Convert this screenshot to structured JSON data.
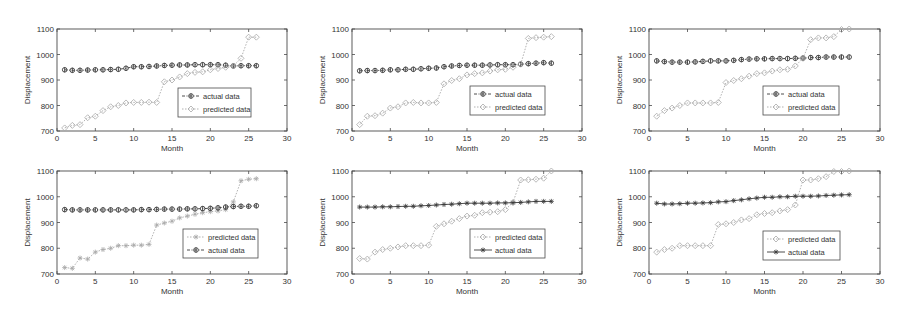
{
  "figure": {
    "layout": {
      "rows": 2,
      "cols": 3
    },
    "colors": {
      "axis": "#4a4a4a",
      "actual": "#3a3a3a",
      "predicted": "#a8a8a8",
      "background": "#ffffff"
    }
  },
  "chart_data": [
    {
      "type": "line",
      "panel": "top-left",
      "title": "",
      "xlabel": "Month",
      "ylabel": "Displacement",
      "xlim": [
        0,
        30
      ],
      "ylim": [
        700,
        1100
      ],
      "xticks": [
        0,
        5,
        10,
        15,
        20,
        25,
        30
      ],
      "yticks": [
        700,
        800,
        900,
        1000,
        1100
      ],
      "grid": false,
      "legend": {
        "position": "lower-right-inset",
        "entries": [
          "actual data",
          "predicted data"
        ]
      },
      "x": [
        1,
        2,
        3,
        4,
        5,
        6,
        7,
        8,
        9,
        10,
        11,
        12,
        13,
        14,
        15,
        16,
        17,
        18,
        19,
        20,
        21,
        22,
        23,
        24,
        25,
        26
      ],
      "series": [
        {
          "name": "actual data",
          "style": "dash-dot, circle-star marker, dark",
          "values": [
            940,
            938,
            938,
            939,
            940,
            940,
            941,
            942,
            946,
            952,
            952,
            953,
            955,
            957,
            958,
            959,
            959,
            960,
            960,
            960,
            960,
            958,
            955,
            956,
            956,
            956
          ]
        },
        {
          "name": "predicted data",
          "style": "dotted, diamond marker, light",
          "values": [
            712,
            722,
            725,
            752,
            758,
            780,
            795,
            800,
            810,
            812,
            812,
            813,
            812,
            893,
            900,
            912,
            925,
            930,
            932,
            940,
            945,
            950,
            955,
            985,
            1068,
            1068
          ]
        }
      ]
    },
    {
      "type": "line",
      "panel": "top-middle",
      "title": "",
      "xlabel": "Month",
      "ylabel": "Displacement",
      "xlim": [
        0,
        30
      ],
      "ylim": [
        700,
        1100
      ],
      "xticks": [
        0,
        5,
        10,
        15,
        20,
        25,
        30
      ],
      "yticks": [
        700,
        800,
        900,
        1000,
        1100
      ],
      "grid": false,
      "legend": {
        "position": "lower-right-inset",
        "entries": [
          "actual data",
          "predicted data"
        ]
      },
      "x": [
        1,
        2,
        3,
        4,
        5,
        6,
        7,
        8,
        9,
        10,
        11,
        12,
        13,
        14,
        15,
        16,
        17,
        18,
        19,
        20,
        21,
        22,
        23,
        24,
        25,
        26
      ],
      "series": [
        {
          "name": "actual data",
          "style": "dash-dot, circle-star marker, dark",
          "values": [
            936,
            937,
            937,
            938,
            940,
            940,
            942,
            942,
            944,
            946,
            947,
            952,
            955,
            957,
            958,
            958,
            958,
            959,
            960,
            960,
            960,
            962,
            964,
            966,
            968,
            966
          ]
        },
        {
          "name": "predicted data",
          "style": "dotted, diamond marker, light",
          "values": [
            725,
            758,
            760,
            770,
            790,
            795,
            810,
            812,
            810,
            810,
            812,
            885,
            898,
            905,
            920,
            925,
            928,
            935,
            940,
            942,
            950,
            962,
            1063,
            1066,
            1068,
            1070
          ]
        }
      ]
    },
    {
      "type": "line",
      "panel": "top-right",
      "title": "",
      "xlabel": "Month",
      "ylabel": "Displacement",
      "xlim": [
        0,
        30
      ],
      "ylim": [
        700,
        1100
      ],
      "xticks": [
        0,
        5,
        10,
        15,
        20,
        25,
        30
      ],
      "yticks": [
        700,
        800,
        900,
        1000,
        1100
      ],
      "grid": false,
      "legend": {
        "position": "lower-right-inset",
        "entries": [
          "actual data",
          "predicted data"
        ]
      },
      "x": [
        1,
        2,
        3,
        4,
        5,
        6,
        7,
        8,
        9,
        10,
        11,
        12,
        13,
        14,
        15,
        16,
        17,
        18,
        19,
        20,
        21,
        22,
        23,
        24,
        25,
        26
      ],
      "series": [
        {
          "name": "actual data",
          "style": "dash-dot, circle-star marker, dark",
          "values": [
            975,
            972,
            970,
            970,
            970,
            971,
            973,
            975,
            975,
            975,
            977,
            980,
            982,
            983,
            983,
            984,
            984,
            984,
            985,
            986,
            988,
            988,
            990,
            990,
            990,
            990
          ]
        },
        {
          "name": "predicted data",
          "style": "dotted, diamond marker, light",
          "values": [
            758,
            780,
            790,
            800,
            810,
            810,
            810,
            810,
            812,
            890,
            898,
            905,
            915,
            925,
            928,
            935,
            940,
            942,
            955,
            985,
            1058,
            1065,
            1065,
            1070,
            1098,
            1100
          ]
        }
      ]
    },
    {
      "type": "line",
      "panel": "bottom-left",
      "title": "",
      "xlabel": "Month",
      "ylabel": "Displacement",
      "xlim": [
        0,
        30
      ],
      "ylim": [
        700,
        1100
      ],
      "xticks": [
        0,
        5,
        10,
        15,
        20,
        25,
        30
      ],
      "yticks": [
        700,
        800,
        900,
        1000,
        1100
      ],
      "grid": false,
      "legend": {
        "position": "lower-right-inset",
        "entries": [
          "predicted data",
          "actual data"
        ]
      },
      "x": [
        1,
        2,
        3,
        4,
        5,
        6,
        7,
        8,
        9,
        10,
        11,
        12,
        13,
        14,
        15,
        16,
        17,
        18,
        19,
        20,
        21,
        22,
        23,
        24,
        25,
        26
      ],
      "series": [
        {
          "name": "predicted data",
          "style": "dotted, star marker, light",
          "values": [
            725,
            722,
            762,
            758,
            785,
            795,
            800,
            810,
            810,
            812,
            812,
            815,
            890,
            898,
            905,
            918,
            925,
            932,
            938,
            942,
            945,
            950,
            980,
            1062,
            1068,
            1070
          ]
        },
        {
          "name": "actual data",
          "style": "dash-dot, circle-star marker, dark",
          "values": [
            950,
            949,
            949,
            949,
            949,
            949,
            949,
            949,
            949,
            949,
            950,
            950,
            951,
            952,
            952,
            952,
            953,
            953,
            954,
            955,
            957,
            960,
            962,
            963,
            963,
            965
          ]
        }
      ]
    },
    {
      "type": "line",
      "panel": "bottom-middle",
      "title": "",
      "xlabel": "Month",
      "ylabel": "Displacement",
      "xlim": [
        0,
        30
      ],
      "ylim": [
        700,
        1100
      ],
      "xticks": [
        0,
        5,
        10,
        15,
        20,
        25,
        30
      ],
      "yticks": [
        700,
        800,
        900,
        1000,
        1100
      ],
      "grid": false,
      "legend": {
        "position": "lower-right-inset",
        "entries": [
          "predicted data",
          "actual data"
        ]
      },
      "x": [
        1,
        2,
        3,
        4,
        5,
        6,
        7,
        8,
        9,
        10,
        11,
        12,
        13,
        14,
        15,
        16,
        17,
        18,
        19,
        20,
        21,
        22,
        23,
        24,
        25,
        26
      ],
      "series": [
        {
          "name": "predicted data",
          "style": "dotted, diamond-circle marker, light",
          "values": [
            760,
            758,
            785,
            795,
            800,
            805,
            810,
            810,
            810,
            812,
            885,
            895,
            905,
            915,
            925,
            928,
            938,
            940,
            942,
            950,
            978,
            1065,
            1066,
            1068,
            1072,
            1100
          ]
        },
        {
          "name": "actual data",
          "style": "solid, star marker, dark",
          "values": [
            960,
            960,
            960,
            961,
            961,
            962,
            963,
            963,
            965,
            966,
            968,
            970,
            971,
            973,
            975,
            975,
            975,
            975,
            976,
            976,
            977,
            978,
            980,
            982,
            982,
            982
          ]
        }
      ]
    },
    {
      "type": "line",
      "panel": "bottom-right",
      "title": "",
      "xlabel": "Month",
      "ylabel": "Displacement",
      "xlim": [
        0,
        30
      ],
      "ylim": [
        700,
        1100
      ],
      "xticks": [
        0,
        5,
        10,
        15,
        20,
        25,
        30
      ],
      "yticks": [
        700,
        800,
        900,
        1000,
        1100
      ],
      "grid": false,
      "legend": {
        "position": "lower-right-inset",
        "entries": [
          "predicted data",
          "actual data"
        ]
      },
      "x": [
        1,
        2,
        3,
        4,
        5,
        6,
        7,
        8,
        9,
        10,
        11,
        12,
        13,
        14,
        15,
        16,
        17,
        18,
        19,
        20,
        21,
        22,
        23,
        24,
        25,
        26
      ],
      "series": [
        {
          "name": "predicted data",
          "style": "dotted, diamond marker, light",
          "values": [
            785,
            795,
            800,
            810,
            810,
            810,
            810,
            810,
            892,
            895,
            900,
            910,
            915,
            930,
            935,
            938,
            945,
            950,
            968,
            1065,
            1065,
            1070,
            1078,
            1098,
            1098,
            1100
          ]
        },
        {
          "name": "actual data",
          "style": "solid, star marker, dark",
          "values": [
            975,
            972,
            972,
            973,
            975,
            975,
            976,
            977,
            980,
            981,
            985,
            988,
            992,
            995,
            998,
            998,
            1000,
            1000,
            1002,
            1002,
            1002,
            1003,
            1005,
            1006,
            1007,
            1008
          ]
        }
      ]
    }
  ]
}
